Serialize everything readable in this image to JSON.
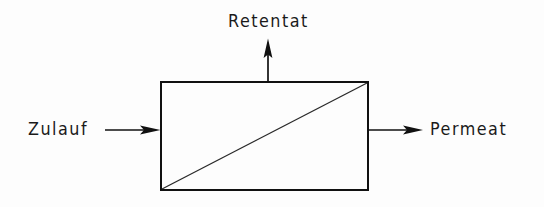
{
  "diagram": {
    "background_color": "#fdfdfd",
    "line_color": "#111111",
    "module": {
      "name": "membrane-module",
      "x": 161,
      "y": 82,
      "width": 207,
      "height": 108,
      "border_width": 2.5,
      "fill": "none"
    },
    "membrane": {
      "name": "membrane-diagonal",
      "x1": 161,
      "y1": 190,
      "x2": 368,
      "y2": 82,
      "stroke_width": 1.2
    },
    "streams": [
      {
        "id": "feed",
        "label": "Zulauf",
        "direction": "right",
        "label_x": 28,
        "label_y": 121,
        "arrow_x1": 105,
        "arrow_y1": 130,
        "arrow_x2": 161,
        "arrow_y2": 130
      },
      {
        "id": "retentate",
        "label": "Retentat",
        "direction": "up",
        "label_x": 228,
        "label_y": 13,
        "arrow_x1": 268,
        "arrow_y1": 82,
        "arrow_x2": 268,
        "arrow_y2": 40
      },
      {
        "id": "permeate",
        "label": "Permeat",
        "direction": "right",
        "label_x": 430,
        "label_y": 121,
        "arrow_x1": 368,
        "arrow_y1": 130,
        "arrow_x2": 422,
        "arrow_y2": 130
      }
    ],
    "labels": {
      "feed": "Zulauf",
      "retentate": "Retentat",
      "permeate": "Permeat"
    }
  }
}
